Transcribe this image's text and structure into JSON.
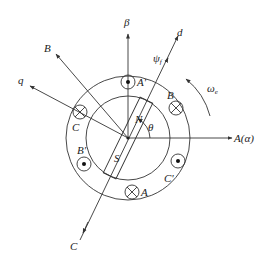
{
  "diagram": {
    "title": "",
    "axes": {
      "alpha": "A(α)",
      "beta": "β",
      "d": "d",
      "q": "q",
      "B": "B",
      "C": "C"
    },
    "labels": {
      "flux": "ψf",
      "flux_base": "ψ",
      "flux_sub": "f",
      "speed": "ωe",
      "speed_base": "ω",
      "speed_sub": "e",
      "theta": "θ",
      "north": "N",
      "south": "S"
    },
    "coils": [
      {
        "name": "A'",
        "symbol": "dot"
      },
      {
        "name": "B",
        "symbol": "cross"
      },
      {
        "name": "C'",
        "symbol": "dot"
      },
      {
        "name": "A",
        "symbol": "cross"
      },
      {
        "name": "B'",
        "symbol": "dot"
      },
      {
        "name": "C",
        "symbol": "cross"
      }
    ]
  }
}
